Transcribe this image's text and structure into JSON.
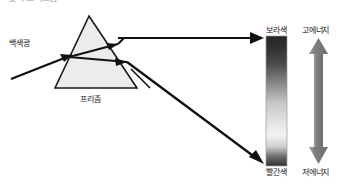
{
  "figure": {
    "title_cut_off": "빛의 스펙트럼",
    "background_color": "#ffffff"
  },
  "prism": {
    "label": "프리즘",
    "fill_color": "#ececec",
    "stroke_color": "#1a1a1a",
    "apex": {
      "x": 89,
      "y": 16
    },
    "base_left": {
      "x": 55,
      "y": 88
    },
    "base_right": {
      "x": 137,
      "y": 88
    }
  },
  "incoming_ray": {
    "label": "백색광",
    "color": "#111111",
    "from": {
      "x": 11,
      "y": 79
    },
    "to": {
      "x": 69,
      "y": 56
    }
  },
  "rays": [
    {
      "name": "violet-ray",
      "color": "#111111",
      "exit_label": "보라색",
      "to": {
        "x": 264,
        "y": 38
      }
    },
    {
      "name": "red-ray",
      "color": "#111111",
      "exit_label": "빨간색",
      "to": {
        "x": 264,
        "y": 163
      }
    }
  ],
  "spectrum": {
    "top_label": "보라색",
    "bottom_label": "빨간색",
    "top_color": "#2b2b2b",
    "upper_mid_color": "#585858",
    "mid_color": "#d8d8d8",
    "lower_mid_color": "#f2f2f2",
    "bottom_color": "#3a3a3a",
    "border_color": "#9a9a9a"
  },
  "energy_arrow": {
    "top_label": "고에너지",
    "bottom_label": "저에너지",
    "color": "#7a7a7a",
    "direction": "double"
  }
}
